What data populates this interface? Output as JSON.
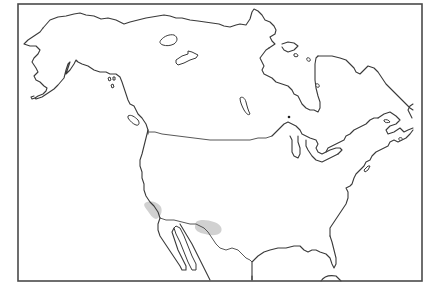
{
  "map": {
    "title": "",
    "type": "outline map",
    "region": "North America",
    "frame": {
      "x": 18,
      "y": 4,
      "width": 404,
      "height": 277,
      "stroke": "#4a4a4a"
    },
    "colors": {
      "background": "#ffffff",
      "outline": "#3a3a3a",
      "shaded_region": "#c9c9c9"
    },
    "shaded_regions": [
      {
        "name": "southern-california-coast",
        "cx": 155,
        "cy": 210
      },
      {
        "name": "southern-arizona-new-mexico",
        "cx": 208,
        "cy": 228
      }
    ],
    "markers": [
      {
        "name": "dot-hudson-bay-south",
        "x": 289,
        "y": 117
      }
    ],
    "labels": []
  }
}
